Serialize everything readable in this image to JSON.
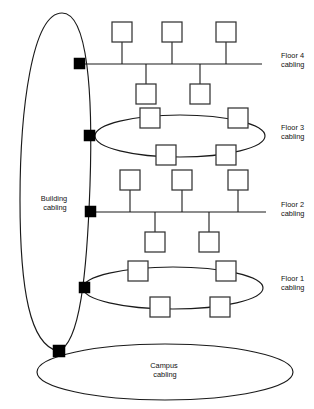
{
  "diagram": {
    "type": "network-cabling-hierarchy",
    "background_color": "#ffffff",
    "line_color": "#1a1a1a",
    "node_fill_color": "#ffffff",
    "node_stroke_color": "#333333",
    "connector_color": "#000000",
    "labels": {
      "building": {
        "line1": "Building",
        "line2": "cabling",
        "x": 55,
        "y": 201
      },
      "campus": {
        "line1": "Campus",
        "line2": "cabling",
        "x": 165,
        "y": 368
      },
      "floor4": {
        "line1": "Floor 4",
        "line2": "cabling",
        "x": 281,
        "y": 58
      },
      "floor3": {
        "line1": "Floor 3",
        "line2": "cabling",
        "x": 281,
        "y": 130
      },
      "floor2": {
        "line1": "Floor 2",
        "line2": "cabling",
        "x": 281,
        "y": 207
      },
      "floor1": {
        "line1": "Floor 1",
        "line2": "cabling",
        "x": 281,
        "y": 281
      }
    },
    "segments": [
      {
        "id": "floor4",
        "name": "Floor 4 cabling",
        "topology": "bus",
        "bus_y": 64,
        "bus_x1": 84,
        "bus_x2": 262,
        "nodes_above": 3,
        "nodes_below": 2,
        "connector": {
          "x": 79,
          "y": 58,
          "size": 11
        }
      },
      {
        "id": "floor3",
        "name": "Floor 3 cabling",
        "topology": "ring",
        "ring_cx": 180,
        "ring_cy": 136,
        "ring_rx": 85,
        "ring_ry": 21,
        "nodes_top": 2,
        "nodes_bottom": 2,
        "connector": {
          "x": 88,
          "y": 130,
          "size": 11
        }
      },
      {
        "id": "floor2",
        "name": "Floor 2 cabling",
        "topology": "bus",
        "bus_y": 212,
        "bus_x1": 92,
        "bus_x2": 266,
        "nodes_above": 3,
        "nodes_below": 2,
        "connector": {
          "x": 88,
          "y": 206,
          "size": 11
        }
      },
      {
        "id": "floor1",
        "name": "Floor 1 cabling",
        "topology": "ring",
        "ring_cx": 173,
        "ring_cy": 288,
        "ring_rx": 90,
        "ring_ry": 21,
        "nodes_top": 2,
        "nodes_bottom": 2,
        "connector": {
          "x": 83,
          "y": 282,
          "size": 11
        }
      }
    ],
    "backbones": [
      {
        "id": "building",
        "name": "Building cabling",
        "shape": "ellipse",
        "cx": 56,
        "cy": 186,
        "rx": 38,
        "ry": 175
      },
      {
        "id": "campus",
        "name": "Campus cabling",
        "shape": "ellipse",
        "cx": 165,
        "cy": 372,
        "rx": 128,
        "ry": 28
      }
    ],
    "junction": {
      "x": 58,
      "y": 351,
      "size": 12,
      "name": "campus-building-junction"
    },
    "node_size": 20,
    "node_count_total": 20
  }
}
